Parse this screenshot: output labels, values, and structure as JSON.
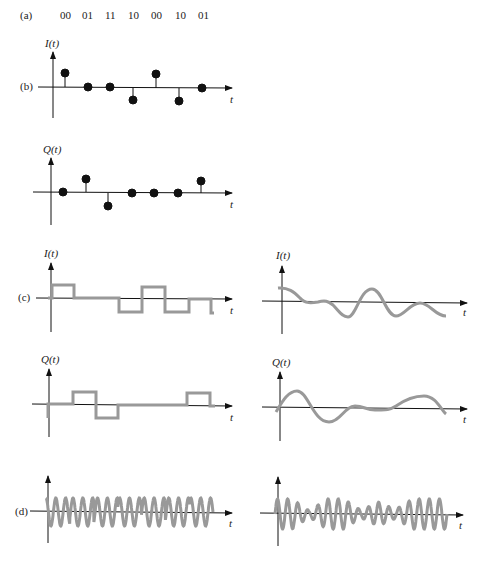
{
  "labels": {
    "a": "(a)",
    "b": "(b)",
    "c": "(c)",
    "d": "(d)"
  },
  "bit_pairs": [
    "00",
    "01",
    "11",
    "10",
    "00",
    "10",
    "01"
  ],
  "axis": {
    "I": "I(t)",
    "Q": "Q(t)",
    "t": "t"
  },
  "colors": {
    "axis": "#111111",
    "dots": "#111111",
    "waveform": "#999999",
    "label": "#222222"
  },
  "chart_data": [
    {
      "id": "b-I",
      "type": "scatter",
      "title": "I(t) impulse samples",
      "ylabel": "I(t)",
      "xlabel": "t",
      "x": [
        1,
        2,
        3,
        4,
        5,
        6,
        7
      ],
      "values": [
        1,
        0,
        0,
        -1,
        1,
        -1,
        0
      ]
    },
    {
      "id": "b-Q",
      "type": "scatter",
      "title": "Q(t) impulse samples",
      "ylabel": "Q(t)",
      "xlabel": "t",
      "x": [
        1,
        2,
        3,
        4,
        5,
        6,
        7
      ],
      "values": [
        0,
        1,
        -1,
        0,
        0,
        0,
        1
      ]
    },
    {
      "id": "c-I-rect",
      "type": "line",
      "title": "I(t) rectangular pulses",
      "ylabel": "I(t)",
      "xlabel": "t",
      "values": [
        1,
        0,
        0,
        -1,
        1,
        -1,
        0
      ]
    },
    {
      "id": "c-Q-rect",
      "type": "line",
      "title": "Q(t) rectangular pulses",
      "ylabel": "Q(t)",
      "xlabel": "t",
      "values": [
        0,
        1,
        -1,
        0,
        0,
        0,
        1
      ]
    },
    {
      "id": "c-I-smooth",
      "type": "line",
      "title": "I(t) filtered",
      "ylabel": "I(t)",
      "xlabel": "t"
    },
    {
      "id": "c-Q-smooth",
      "type": "line",
      "title": "Q(t) filtered",
      "ylabel": "Q(t)",
      "xlabel": "t"
    },
    {
      "id": "d-rect",
      "type": "line",
      "title": "modulated carrier (rectangular)",
      "xlabel": "t"
    },
    {
      "id": "d-smooth",
      "type": "line",
      "title": "modulated carrier (filtered)",
      "xlabel": "t"
    }
  ]
}
